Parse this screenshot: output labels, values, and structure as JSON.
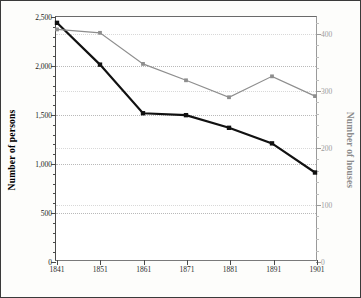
{
  "chart_data": {
    "type": "line",
    "title": "",
    "xlabel": "",
    "x": [
      1841,
      1851,
      1861,
      1871,
      1881,
      1891,
      1901
    ],
    "xtick_labels": [
      "1841",
      "1851",
      "1861",
      "1871",
      "1881",
      "1891",
      "1901"
    ],
    "grid": true,
    "legend": "none",
    "axes": {
      "left": {
        "label": "Number of persons",
        "ylim": [
          0,
          2500
        ],
        "ticks": [
          0,
          500,
          1000,
          1500,
          2000,
          2500
        ],
        "tick_labels": [
          "0",
          "500",
          "1,000",
          "1,500",
          "2,000",
          "2,500"
        ],
        "color": "#000000"
      },
      "right": {
        "label": "Number of houses",
        "ylim": [
          0,
          430
        ],
        "ticks": [
          0,
          100,
          200,
          300,
          400
        ],
        "tick_labels": [
          "0",
          "100",
          "200",
          "300",
          "400"
        ],
        "color": "#8c8c8c"
      }
    },
    "series": [
      {
        "name": "Number of persons",
        "axis": "left",
        "color": "#111111",
        "marker": "square",
        "values": [
          2440,
          2010,
          1510,
          1490,
          1360,
          1200,
          900
        ]
      },
      {
        "name": "Number of houses",
        "axis": "right",
        "color": "#8e8e8e",
        "marker": "square",
        "values": [
          408,
          402,
          347,
          318,
          288,
          325,
          290
        ]
      }
    ]
  }
}
